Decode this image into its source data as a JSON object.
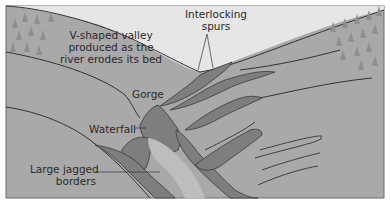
{
  "diagram": {
    "colors": {
      "sky": "#e6e6e6",
      "land": "#a9a9a9",
      "land_light": "#b4b4b4",
      "rock": "#7e7e7e",
      "rock_outline": "#3a3a3a",
      "line": "#333333",
      "tree": "#8e8e8e",
      "frame": "#6a6a6a",
      "text": "#2a2a2a"
    },
    "labels": {
      "interlocking_spurs": [
        "Interlocking",
        "spurs"
      ],
      "v_valley": [
        "V-shaped valley",
        "produced as the",
        "river erodes its bed"
      ],
      "gorge": "Gorge",
      "waterfall": "Waterfall",
      "jagged_borders": [
        "Large jagged",
        "borders"
      ]
    }
  }
}
